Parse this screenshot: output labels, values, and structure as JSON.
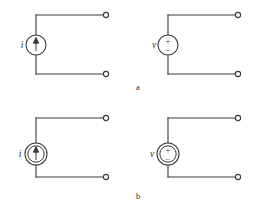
{
  "figure": {
    "background_color": "#ffffff",
    "line_color": "#3a3a3a",
    "rows": [
      {
        "caption": "a",
        "caption_x": 138,
        "caption_y": 90,
        "kind": "independent",
        "circle_style": "single",
        "cells": [
          {
            "name": "independent-current-source",
            "label": "i",
            "symbol": "arrow-up",
            "polarity_top": "",
            "polarity_bottom": ""
          },
          {
            "name": "independent-voltage-source",
            "label": "v",
            "symbol": "plus-minus",
            "polarity_top": "+",
            "polarity_bottom": "−"
          }
        ]
      },
      {
        "caption": "b",
        "caption_x": 138,
        "caption_y": 199,
        "kind": "dependent",
        "circle_style": "double",
        "cells": [
          {
            "name": "dependent-current-source",
            "label": "i",
            "symbol": "arrow-up",
            "polarity_top": "",
            "polarity_bottom": ""
          },
          {
            "name": "dependent-voltage-source",
            "label": "v",
            "symbol": "plus-minus",
            "polarity_top": "+",
            "polarity_bottom": "−"
          }
        ]
      }
    ],
    "geometry": {
      "note": "four identical circuits, 2 columns x 2 rows",
      "column_origin_x": [
        36,
        168
      ],
      "row_origin_y": [
        15,
        118
      ],
      "top_wire_length": 70,
      "bottom_wire_length": 70,
      "vertical_span": 59,
      "source_radius_outer": 10,
      "source_radius_inner": 7.6,
      "terminal_radius": 2.6
    }
  }
}
